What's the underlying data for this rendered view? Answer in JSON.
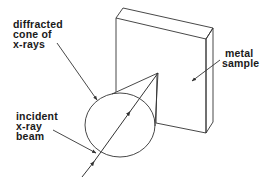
{
  "diagram": {
    "labels": {
      "diffracted_cone": [
        "diffracted",
        "cone of",
        "x-rays"
      ],
      "metal_sample": [
        "metal",
        "sample"
      ],
      "incident_beam": [
        "incident",
        "x-ray",
        "beam"
      ]
    },
    "colors": {
      "line": "#333333",
      "text": "#1a1a1a",
      "background": "#ffffff"
    }
  }
}
